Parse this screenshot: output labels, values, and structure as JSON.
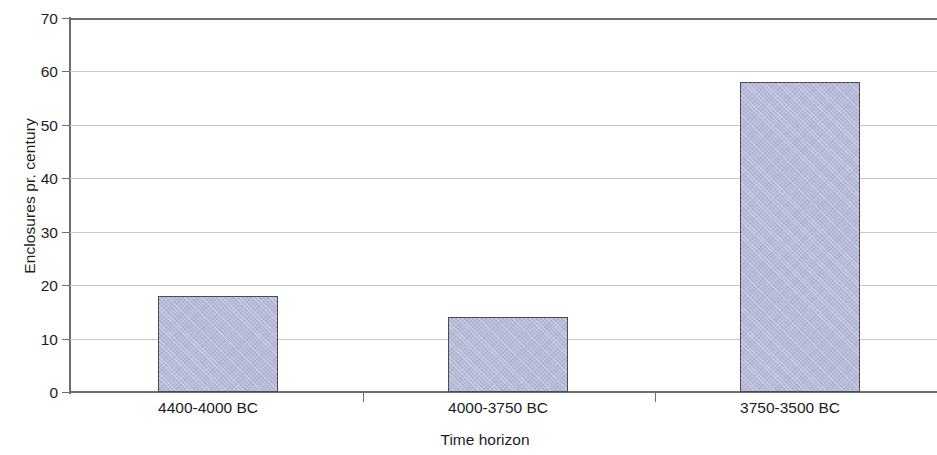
{
  "chart_data": {
    "type": "bar",
    "title": "",
    "xlabel": "Time horizon",
    "ylabel": "Enclosures pr. century",
    "categories": [
      "4400-4000 BC",
      "4000-3750 BC",
      "3750-3500 BC"
    ],
    "values": [
      18,
      14,
      58
    ],
    "series": [
      {
        "name": "Enclosures pr. century",
        "values": [
          18,
          14,
          58
        ]
      }
    ],
    "ylim": [
      0,
      70
    ],
    "y_ticks": [
      0,
      10,
      20,
      30,
      40,
      50,
      60,
      70
    ],
    "y_tick_labels": [
      "0",
      "10",
      "20",
      "30",
      "40",
      "50",
      "60",
      "70"
    ],
    "grid": "horizontal",
    "legend": "none",
    "bar_fill_color": "#b6bad8",
    "bar_border_color": "#4b4b5c",
    "gridline_color": "#c9c9c9",
    "axis_color": "#6e6e6e",
    "text_color": "#1d1d1d",
    "background_color": "#ffffff"
  }
}
